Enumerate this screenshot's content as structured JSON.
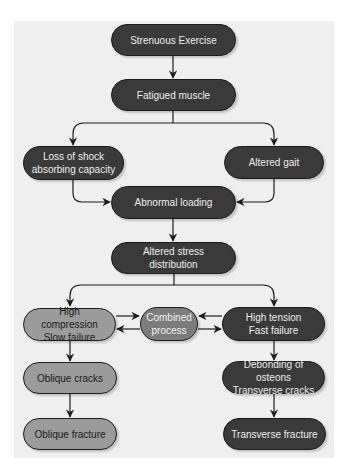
{
  "diagram": {
    "type": "flowchart",
    "colors": {
      "panel_background": "#efefef",
      "dark_node": "#3a3a3a",
      "light_node": "#9b9b9b",
      "combined_node": "#7c7c7c",
      "connector": "#1c1c1c"
    },
    "nodes": {
      "strenuous_exercise": "Strenuous Exercise",
      "fatigued_muscle": "Fatigued muscle",
      "loss_of_shock": "Loss of shock\nabsorbing capacity",
      "altered_gait": "Altered gait",
      "abnormal_loading": "Abnormal loading",
      "altered_stress": "Altered stress distribution",
      "high_compression": "High compression\nSlow failure",
      "combined_process": "Combined\nprocess",
      "high_tension": "High tension\nFast failure",
      "oblique_cracks": "Oblique cracks",
      "debonding": "Debonding of osteons\nTransverse cracks",
      "oblique_fracture": "Oblique fracture",
      "transverse_fracture": "Transverse fracture"
    },
    "edges": [
      [
        "Strenuous Exercise",
        "Fatigued muscle"
      ],
      [
        "Fatigued muscle",
        "Loss of shock absorbing capacity"
      ],
      [
        "Fatigued muscle",
        "Altered gait"
      ],
      [
        "Loss of shock absorbing capacity",
        "Abnormal loading"
      ],
      [
        "Altered gait",
        "Abnormal loading"
      ],
      [
        "Abnormal loading",
        "Altered stress distribution"
      ],
      [
        "Altered stress distribution",
        "High compression Slow failure"
      ],
      [
        "Altered stress distribution",
        "High tension Fast failure"
      ],
      [
        "High compression Slow failure",
        "Combined process"
      ],
      [
        "Combined process",
        "High compression Slow failure"
      ],
      [
        "High tension Fast failure",
        "Combined process"
      ],
      [
        "Combined process",
        "High tension Fast failure"
      ],
      [
        "High compression Slow failure",
        "Oblique cracks"
      ],
      [
        "Oblique cracks",
        "Oblique fracture"
      ],
      [
        "High tension Fast failure",
        "Debonding of osteons Transverse cracks"
      ],
      [
        "Debonding of osteons Transverse cracks",
        "Transverse fracture"
      ]
    ]
  }
}
